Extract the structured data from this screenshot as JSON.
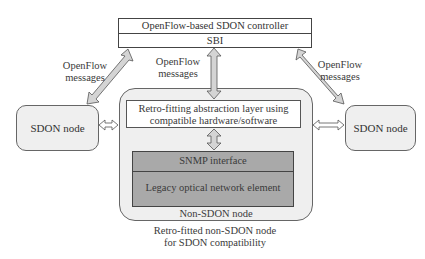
{
  "controller": {
    "title": "OpenFlow-based SDON controller",
    "interface": "SBI"
  },
  "messages": {
    "left": [
      "OpenFlow",
      "messages"
    ],
    "center": [
      "OpenFlow",
      "messages"
    ],
    "right": [
      "OpenFlow",
      "messages"
    ]
  },
  "sdon_nodes": {
    "left": "SDON node",
    "right": "SDON node"
  },
  "non_sdon_node": {
    "abstraction_layer": [
      "Retro-fitting abstraction layer using",
      "compatible hardware/software"
    ],
    "snmp_interface": "SNMP interface",
    "legacy_element": "Legacy optical network element",
    "label": "Non-SDON node"
  },
  "caption": [
    "Retro-fitted non-SDON node",
    "for SDON compatibility"
  ],
  "colors": {
    "node_fill": "#efefef",
    "gray_block": "#a9a9a9",
    "arrow_fill": "#d4d4d4",
    "stroke": "#444444"
  }
}
